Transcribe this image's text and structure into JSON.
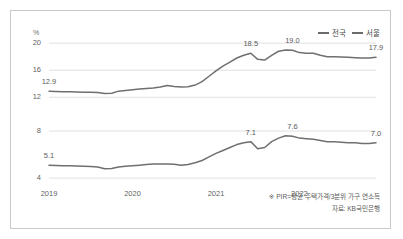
{
  "figure": {
    "unit_label": "%",
    "legend": [
      {
        "name": "series-nationwide",
        "label": "전국",
        "color": "#6b6b6b"
      },
      {
        "name": "series-seoul",
        "label": "서울",
        "color": "#6b6b6b"
      }
    ],
    "footnotes": [
      "※ PIR=평균 주택가격/3분위 가구 연소득",
      "자료: KB국민은행"
    ]
  },
  "chart_data": {
    "type": "line",
    "title": "",
    "subtitle": "",
    "xlabel": "",
    "ylabel": "%",
    "grid": true,
    "legend_position": "top-right",
    "panels": [
      {
        "name": "upper-panel",
        "series_label": "서울",
        "ylim": [
          11.0,
          21.5
        ],
        "yticks": [
          12,
          16,
          20
        ],
        "ytick_labels": [
          "12",
          "16",
          "20"
        ],
        "annotations": [
          {
            "label": "12.9",
            "x_index": 0,
            "value": 12.9
          },
          {
            "label": "18.5",
            "x_index": 29,
            "value": 18.5
          },
          {
            "label": "19.0",
            "x_index": 35,
            "value": 19.0
          },
          {
            "label": "17.9",
            "x_index": 47,
            "value": 17.9
          }
        ],
        "values": [
          12.9,
          12.85,
          12.8,
          12.8,
          12.78,
          12.75,
          12.72,
          12.7,
          12.55,
          12.6,
          12.9,
          13.0,
          13.1,
          13.2,
          13.3,
          13.35,
          13.5,
          13.75,
          13.6,
          13.5,
          13.55,
          13.8,
          14.3,
          15.1,
          15.9,
          16.6,
          17.2,
          17.8,
          18.2,
          18.5,
          17.6,
          17.5,
          18.2,
          18.8,
          19.0,
          18.95,
          18.6,
          18.5,
          18.5,
          18.2,
          18.0,
          18.0,
          17.95,
          17.9,
          17.85,
          17.8,
          17.8,
          17.9
        ]
      },
      {
        "name": "lower-panel",
        "series_label": "전국",
        "ylim": [
          3.5,
          8.6
        ],
        "yticks": [
          4,
          8
        ],
        "ytick_labels": [
          "4",
          "8"
        ],
        "annotations": [
          {
            "label": "5.1",
            "x_index": 0,
            "value": 5.1
          },
          {
            "label": "7.1",
            "x_index": 29,
            "value": 7.1
          },
          {
            "label": "7.6",
            "x_index": 35,
            "value": 7.6
          },
          {
            "label": "7.0",
            "x_index": 47,
            "value": 7.0
          }
        ],
        "values": [
          5.1,
          5.08,
          5.05,
          5.05,
          5.02,
          5.0,
          4.98,
          4.95,
          4.8,
          4.82,
          4.95,
          5.0,
          5.05,
          5.1,
          5.15,
          5.2,
          5.2,
          5.2,
          5.18,
          5.1,
          5.15,
          5.3,
          5.5,
          5.8,
          6.1,
          6.35,
          6.6,
          6.85,
          7.0,
          7.1,
          6.5,
          6.6,
          7.1,
          7.4,
          7.6,
          7.55,
          7.4,
          7.35,
          7.3,
          7.2,
          7.1,
          7.1,
          7.05,
          7.0,
          7.0,
          6.95,
          6.95,
          7.0
        ]
      }
    ],
    "x_ticks": [
      {
        "label": "2019",
        "index": 0
      },
      {
        "label": "2020",
        "index": 12
      },
      {
        "label": "2021",
        "index": 24
      },
      {
        "label": "2022",
        "index": 36
      }
    ],
    "x_count": 48
  }
}
